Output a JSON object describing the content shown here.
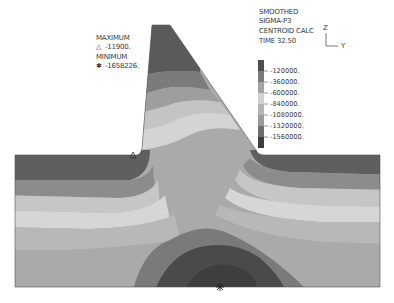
{
  "header": {
    "line1": "SMOOTHED",
    "line2": "SIGMA-P3",
    "line3": "CENTROID CALC",
    "line4": "TIME 32.50"
  },
  "axes_triad": {
    "vertical": "Z",
    "horizontal": "Y"
  },
  "extremes": {
    "maximum_label": "MAXIMUM",
    "maximum_symbol": "△",
    "maximum_value": "-11900.",
    "minimum_label": "MINIMUM",
    "minimum_symbol": "✱",
    "minimum_value": "-1658226."
  },
  "legend": {
    "labels": [
      "-120000.",
      "-360000.",
      "-600000.",
      "-840000.",
      "-1080000.",
      "-1320000.",
      "-1560000."
    ],
    "colors": [
      "#4e4e4e",
      "#7a7a7a",
      "#a3a3a3",
      "#d2d2d2",
      "#b4b4b4",
      "#9a9a9a",
      "#6e6e6e",
      "#3c3c3c"
    ]
  },
  "contour_colors": {
    "darkest": "#474747",
    "dark": "#6d6d6d",
    "mid_dark": "#8d8d8d",
    "mid": "#a8a8a8",
    "light": "#c3c3c3",
    "lightest": "#d9d9d9",
    "base": "#b0b0b0",
    "base2": "#a2a2a2"
  }
}
